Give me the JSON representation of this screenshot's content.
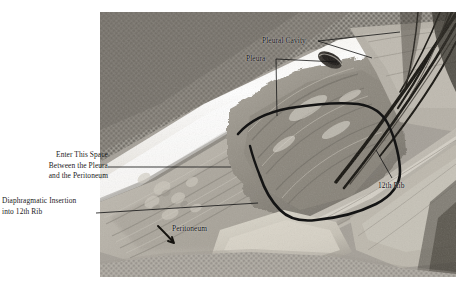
{
  "figure": {
    "kind": "anatomical-dissection-photograph",
    "photo_frame": {
      "x": 100,
      "y": 12,
      "width": 356,
      "height": 265
    },
    "page_background": "#ffffff",
    "label_color": "#1b1b1b",
    "leader_color": "#1b1b1b",
    "outline_color": "#141414"
  },
  "labels": [
    {
      "id": "enter-this-space",
      "text": "Enter This Space\nBetween the Pleura\nand the Peritoneum",
      "line1": "Enter This Space",
      "line2": "Between the Pleura",
      "line3": "and the Peritoneum",
      "align": "right",
      "placement": "outside-left",
      "x": 10,
      "y": 150
    },
    {
      "id": "diaphragmatic-insertion",
      "text": "Diaphragmatic Insertion\ninto 12th Rib",
      "line1": "Diaphragmatic Insertion",
      "line2": "into 12th Rib",
      "align": "left",
      "placement": "outside-left",
      "x": 2,
      "y": 196
    },
    {
      "id": "pleural-cavity",
      "text": "Pleural Cavity",
      "align": "left",
      "placement": "on-photo",
      "x": 262,
      "y": 36
    },
    {
      "id": "pleura",
      "text": "Pleura",
      "align": "left",
      "placement": "on-photo",
      "x": 246,
      "y": 54
    },
    {
      "id": "twelfth-rib",
      "text": "12th Rib",
      "align": "left",
      "placement": "on-photo",
      "x": 378,
      "y": 181
    },
    {
      "id": "peritoneum",
      "text": "Peritoneum",
      "align": "left",
      "placement": "on-photo",
      "x": 172,
      "y": 224
    }
  ],
  "leader_lines": [
    {
      "from": "enter-this-space",
      "x1": 108,
      "y1": 167,
      "x2": 231,
      "y2": 167
    },
    {
      "from": "diaphragmatic-insertion",
      "x1": 96,
      "y1": 213,
      "x2": 258,
      "y2": 203
    },
    {
      "from": "pleural-cavity",
      "x1": 318,
      "y1": 41,
      "x2": 398,
      "y2": 33
    },
    {
      "from": "pleural-cavity",
      "x1": 318,
      "y1": 41,
      "x2": 371,
      "y2": 57
    },
    {
      "from": "pleura",
      "x1": 276,
      "y1": 60,
      "x2": 276,
      "y2": 115
    },
    {
      "from": "pleura",
      "x1": 276,
      "y1": 60,
      "x2": 337,
      "y2": 62
    },
    {
      "from": "twelfth-rib",
      "x1": 392,
      "y1": 178,
      "x2": 375,
      "y2": 150
    }
  ]
}
